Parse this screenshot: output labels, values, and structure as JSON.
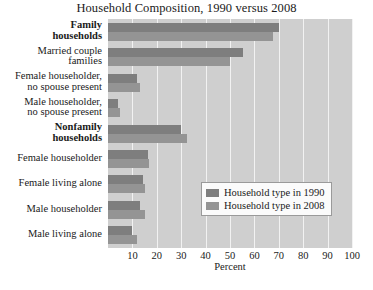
{
  "chart_data": {
    "type": "bar",
    "orientation": "horizontal",
    "title": "Household Composition, 1990 versus 2008",
    "xlabel": "Percent",
    "ylabel": "",
    "xlim": [
      0,
      100
    ],
    "xticks": [
      10,
      20,
      30,
      40,
      50,
      60,
      70,
      80,
      90,
      100
    ],
    "grid": true,
    "legend_position": "inner-right",
    "categories": [
      "Family\nhouseholds",
      "Married couple\nfamilies",
      "Female householder,\nno spouse present",
      "Male householder,\nno spouse present",
      "Nonfamily\nhouseholds",
      "Female householder",
      "Female living alone",
      "Male householder",
      "Male living alone"
    ],
    "categories_bold": [
      true,
      false,
      false,
      false,
      true,
      false,
      false,
      false,
      false
    ],
    "series": [
      {
        "name": "Household type in 1990",
        "color": "#7e7e7e",
        "values": [
          70.0,
          55.5,
          12.0,
          4.0,
          30.0,
          16.5,
          14.5,
          13.0,
          10.0
        ]
      },
      {
        "name": "Household type in 2008",
        "color": "#949494",
        "values": [
          67.5,
          50.0,
          13.0,
          5.0,
          32.5,
          17.0,
          15.0,
          15.0,
          12.0
        ]
      }
    ]
  },
  "legend": {
    "entries": [
      {
        "label": "Household type in 1990"
      },
      {
        "label": "Household type in 2008"
      }
    ]
  },
  "colors": {
    "plot_background": "#cfcfcf",
    "gridline": "#f2f2f2",
    "page_background": "#ffffff",
    "series_1990": "#7e7e7e",
    "series_2008": "#949494"
  }
}
